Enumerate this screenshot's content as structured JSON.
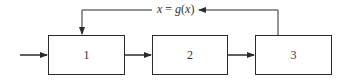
{
  "diagram": {
    "type": "block-diagram",
    "blocks": [
      {
        "id": "1",
        "label": "1"
      },
      {
        "id": "2",
        "label": "2"
      },
      {
        "id": "3",
        "label": "3"
      }
    ],
    "feedback": {
      "label_var": "x",
      "label_eq": " = ",
      "label_func": "g",
      "label_open": "(",
      "label_arg": "x",
      "label_close": ")",
      "label_full": "x = g(x)",
      "from": "3",
      "to": "1"
    },
    "edges": [
      {
        "from": "input",
        "to": "1"
      },
      {
        "from": "1",
        "to": "2"
      },
      {
        "from": "2",
        "to": "3"
      },
      {
        "from": "3",
        "to": "1",
        "label": "x = g(x)"
      }
    ],
    "colors": {
      "stroke": "#2a2a2a",
      "text": "#333333",
      "background": "#ffffff"
    }
  }
}
